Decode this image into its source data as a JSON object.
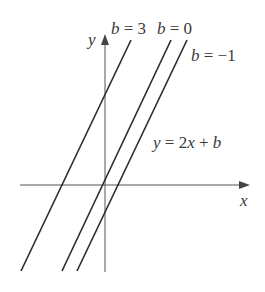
{
  "figure": {
    "equation": "y = 2x + b",
    "axes": {
      "x_label": "x",
      "y_label": "y"
    },
    "lines": [
      {
        "label": "b = 3",
        "b": 3
      },
      {
        "label": "b = 0",
        "b": 0
      },
      {
        "label": "b = −1",
        "b": -1
      }
    ],
    "colors": {
      "line": "#2a2a2a",
      "axis": "#555555",
      "text": "#3a3a3a"
    }
  },
  "labels": {
    "y_axis": "y",
    "x_axis": "x",
    "b3_var": "b",
    "b3_eq": " = 3",
    "b0_var": "b",
    "b0_eq": " = 0",
    "bm1_var": "b",
    "bm1_eq": " = −1",
    "eq_y": "y",
    "eq_mid": " = 2",
    "eq_x": "x",
    "eq_plus": " + ",
    "eq_b": "b"
  }
}
